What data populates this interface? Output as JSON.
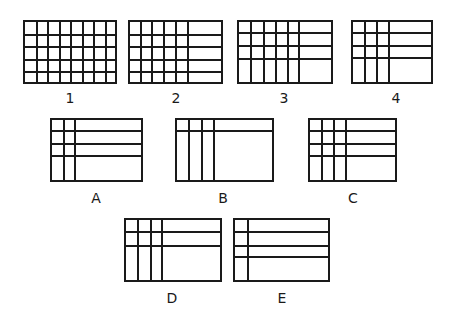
{
  "figures": [
    {
      "id": "1",
      "label": "1",
      "box": [
        23,
        20,
        94,
        64
      ],
      "cols": [
        11.5,
        23,
        34.5,
        46,
        57.5,
        69,
        80.5
      ],
      "rows": [
        12.5,
        25,
        37.5,
        50
      ],
      "label_pos": [
        70,
        90
      ]
    },
    {
      "id": "2",
      "label": "2",
      "box": [
        128,
        20,
        95,
        64
      ],
      "cols": [
        11,
        22,
        34,
        46,
        58
      ],
      "rows": [
        12.5,
        25,
        37.5,
        50
      ],
      "label_pos": [
        176,
        90
      ]
    },
    {
      "id": "3",
      "label": "3",
      "box": [
        237,
        20,
        96,
        64
      ],
      "cols": [
        12,
        25,
        37,
        49,
        60
      ],
      "rows": [
        11,
        24,
        37
      ],
      "label_pos": [
        284,
        90
      ]
    },
    {
      "id": "4",
      "label": "4",
      "box": [
        351,
        20,
        82,
        64
      ],
      "cols": [
        12,
        24,
        36
      ],
      "rows": [
        11,
        24,
        36
      ],
      "label_pos": [
        396,
        90
      ]
    },
    {
      "id": "A",
      "label": "A",
      "box": [
        50,
        118,
        93,
        64
      ],
      "cols": [
        12,
        23
      ],
      "rows": [
        11,
        24,
        36
      ],
      "label_pos": [
        96,
        190
      ]
    },
    {
      "id": "B",
      "label": "B",
      "box": [
        175,
        118,
        99,
        64
      ],
      "cols": [
        12,
        25,
        37
      ],
      "rows": [
        11
      ],
      "label_pos": [
        223,
        190
      ]
    },
    {
      "id": "C",
      "label": "C",
      "box": [
        308,
        118,
        89,
        64
      ],
      "cols": [
        12,
        24,
        36
      ],
      "rows": [
        11,
        24,
        36
      ],
      "label_pos": [
        353,
        190
      ]
    },
    {
      "id": "D",
      "label": "D",
      "box": [
        124,
        218,
        98,
        64
      ],
      "cols": [
        12,
        25,
        36
      ],
      "rows": [
        12,
        26
      ],
      "label_pos": [
        172,
        290
      ]
    },
    {
      "id": "E",
      "label": "E",
      "box": [
        233,
        218,
        97,
        64
      ],
      "cols": [
        13
      ],
      "rows": [
        12,
        26,
        37
      ],
      "label_pos": [
        282,
        290
      ]
    }
  ],
  "labels": {
    "1": "1",
    "2": "2",
    "3": "3",
    "4": "4",
    "A": "A",
    "B": "B",
    "C": "C",
    "D": "D",
    "E": "E"
  },
  "colors": {
    "line": "#1a1a1a",
    "background": "#ffffff"
  }
}
